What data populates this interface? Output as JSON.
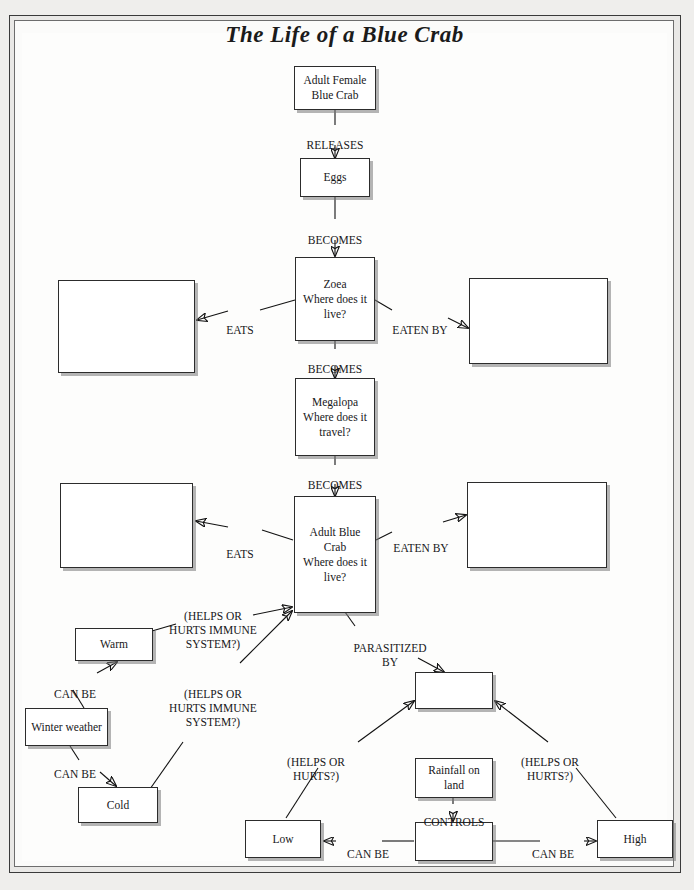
{
  "document": {
    "title": "The Life of a Blue Crab"
  },
  "nodes": {
    "adult_female": "Adult Female\nBlue Crab",
    "eggs": "Eggs",
    "zoea": "Zoea\nWhere does it\nlive?",
    "megalopa": "Megalopa\nWhere does it\ntravel?",
    "adult_crab": "Adult Blue\nCrab\nWhere does it\nlive?",
    "zoea_eats_blank": "",
    "zoea_eaten_by_blank": "",
    "adult_eats_blank": "",
    "adult_eaten_by_blank": "",
    "parasite_blank": "",
    "winter_weather": "Winter weather",
    "warm": "Warm",
    "cold": "Cold",
    "rainfall": "Rainfall on\nland",
    "salinity_blank": "",
    "low": "Low",
    "high": "High"
  },
  "edge_labels": {
    "releases": "RELEASES",
    "becomes_1": "BECOMES",
    "becomes_2": "BECOMES",
    "becomes_3": "BECOMES",
    "zoea_eats": "EATS",
    "zoea_eaten_by": "EATEN BY",
    "adult_eats": "EATS",
    "adult_eaten_by": "EATEN BY",
    "parasitized_by": "PARASITIZED\nBY",
    "immune_warm": "(HELPS OR\nHURTS IMMUNE\nSYSTEM?)",
    "immune_cold": "(HELPS OR\nHURTS IMMUNE\nSYSTEM?)",
    "can_be_warm": "CAN BE",
    "can_be_cold": "CAN BE",
    "helps_hurts_low": "(HELPS OR\nHURTS?)",
    "helps_hurts_high": "(HELPS OR\nHURTS?)",
    "controls": "CONTROLS",
    "can_be_low": "CAN BE",
    "can_be_high": "CAN  BE"
  },
  "colors": {
    "page_background": "#fdfdfc",
    "box_fill": "#ffffff",
    "box_border": "#2c2c2c",
    "shadow": "#787878",
    "text": "#17171a",
    "frame": "#3a3a3a"
  }
}
